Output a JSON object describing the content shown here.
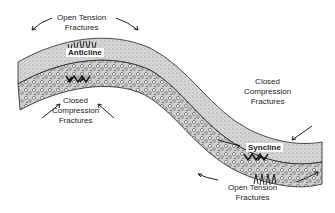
{
  "diagram": {
    "type": "geologic-fold-cross-section",
    "labels": {
      "anticline": "Anticline",
      "syncline": "Syncline",
      "top_left_open_line1": "Open Tension",
      "top_left_open_line2": "Fractures",
      "bottom_left_closed_line1": "Closed",
      "bottom_left_closed_line2": "Compression",
      "bottom_left_closed_line3": "Fractures",
      "right_closed_line1": "Closed",
      "right_closed_line2": "Compression",
      "right_closed_line3": "Fractures",
      "bottom_right_open_line1": "Open Tension",
      "bottom_right_open_line2": "Fractures"
    },
    "layers": [
      {
        "name": "upper-layer",
        "pattern": "fine-stipple",
        "color": "#d4d4d4"
      },
      {
        "name": "lower-layer",
        "pattern": "conglomerate-pebbles",
        "color": "#bdbdbd"
      }
    ],
    "colors": {
      "ink": "#222222",
      "stipple": "#d0d0d0",
      "pebble": "#c4c4c4"
    }
  }
}
